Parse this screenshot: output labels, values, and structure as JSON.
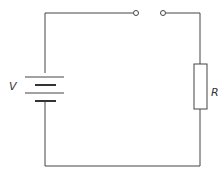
{
  "diagram": {
    "type": "circuit",
    "title": "",
    "components": [
      {
        "id": "battery",
        "kind": "cell/battery",
        "label": "V"
      },
      {
        "id": "switch",
        "kind": "open-terminals (gap)",
        "label": ""
      },
      {
        "id": "resistor",
        "kind": "resistor",
        "label": "R"
      }
    ],
    "labels": {
      "battery": "V",
      "resistor": "R"
    },
    "colors": {
      "line": "#444444",
      "background": "#ffffff"
    }
  }
}
